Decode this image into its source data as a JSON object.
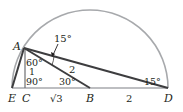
{
  "diagram": {
    "points": {
      "A": {
        "label": "A"
      },
      "B": {
        "label": "B"
      },
      "C": {
        "label": "C"
      },
      "D": {
        "label": "D"
      },
      "E": {
        "label": "E"
      }
    },
    "angles": {
      "top_at_A": "15°",
      "at_A_upper": "60°",
      "at_C": "90°",
      "at_B": "30°",
      "at_D": "15°"
    },
    "lengths": {
      "AC": "1",
      "AB": "2",
      "CB": "√3",
      "BD": "2"
    },
    "colors": {
      "arc": "#a7a9ac",
      "baseline": "#a7a9ac",
      "segments": "#3d3d3f",
      "text": "#231f20"
    }
  }
}
